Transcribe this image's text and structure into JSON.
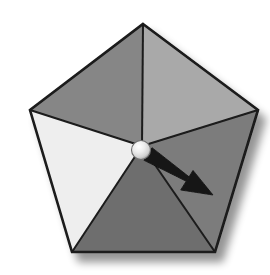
{
  "figure": {
    "name": "pentagon-spinner",
    "background_color": "#ffffff",
    "outline_color": "#1a1a1a",
    "outline_width": 2.6,
    "shadow_color": "#b9b9b9"
  },
  "pentagon": {
    "center": {
      "x": 142,
      "y": 146
    },
    "vertices": [
      {
        "id": "top",
        "x": 143,
        "y": 24
      },
      {
        "id": "right",
        "x": 258,
        "y": 110
      },
      {
        "id": "bottom-right",
        "x": 215,
        "y": 252
      },
      {
        "id": "bottom-left",
        "x": 72,
        "y": 252
      },
      {
        "id": "left",
        "x": 30,
        "y": 110
      }
    ]
  },
  "sectors": [
    {
      "id": "sector-upper-right",
      "label": "upper-right",
      "fill": "#a9a9a9",
      "from_vertex": "top",
      "to_vertex": "right"
    },
    {
      "id": "sector-right",
      "label": "right",
      "fill": "#7c7c7c",
      "from_vertex": "right",
      "to_vertex": "bottom-right"
    },
    {
      "id": "sector-bottom",
      "label": "bottom",
      "fill": "#6e6e6e",
      "from_vertex": "bottom-right",
      "to_vertex": "bottom-left"
    },
    {
      "id": "sector-left",
      "label": "left",
      "fill": "#eeeeee",
      "from_vertex": "bottom-left",
      "to_vertex": "left"
    },
    {
      "id": "sector-upper-left",
      "label": "upper-left",
      "fill": "#868686",
      "from_vertex": "left",
      "to_vertex": "top"
    }
  ],
  "hub": {
    "id": "pivot-hub",
    "center": {
      "x": 141,
      "y": 150
    },
    "radius": 9.5,
    "fill_light": "#fbfbfb",
    "fill_mid": "#e2e2e2",
    "fill_dark": "#9a9a9a",
    "stroke": "#6d6d6d"
  },
  "pointer": {
    "id": "pointer-arrow",
    "color": "#141414",
    "tail": {
      "x": 148,
      "y": 154
    },
    "tip": {
      "x": 213,
      "y": 195
    },
    "angle_degrees": 32,
    "selected_sector": "sector-right"
  }
}
